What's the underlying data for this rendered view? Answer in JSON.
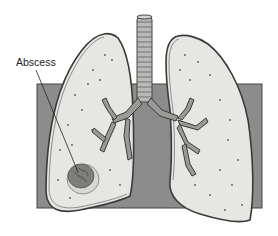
{
  "diagram": {
    "labels": [
      {
        "id": "abscess",
        "text": "Abscess",
        "x": 12,
        "y": 57
      }
    ],
    "colors": {
      "background": "#ffffff",
      "backdrop": "#8c8c8c",
      "lung_fill": "#e6e6e2",
      "lung_outline": "#3a3a3a",
      "trachea_fill": "#b9b9b5",
      "bronchi_fill": "#9a9a96",
      "abscess_fill": "#7d7d7a"
    }
  }
}
